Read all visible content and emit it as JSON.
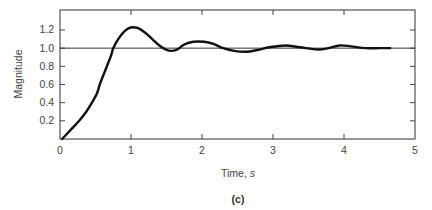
{
  "chart_data": {
    "type": "line",
    "title": "",
    "caption": "(c)",
    "xlabel": "Time, s",
    "xlabel_text": "Time, ",
    "xlabel_unit": "s",
    "ylabel": "Magnitude",
    "xlim": [
      0,
      5
    ],
    "ylim": [
      0,
      1.42
    ],
    "x_ticks": [
      0,
      1,
      2,
      3,
      4,
      5
    ],
    "x_tick_labels": [
      "0",
      "1",
      "2",
      "3",
      "4",
      "5"
    ],
    "y_ticks": [
      0.2,
      0.4,
      0.6,
      0.8,
      1.0,
      1.2
    ],
    "y_tick_labels": [
      "0.2",
      "0.4",
      "0.6",
      "0.8",
      "1.0",
      "1.2"
    ],
    "grid": false,
    "legend": null,
    "reference_line": {
      "y": 1.0,
      "label": "steady-state"
    },
    "series": [
      {
        "name": "Step response",
        "x": [
          0.03,
          0.15,
          0.27,
          0.37,
          0.45,
          0.52,
          0.56,
          0.62,
          0.66,
          0.72,
          0.75,
          0.82,
          0.9,
          0.97,
          1.03,
          1.1,
          1.2,
          1.3,
          1.4,
          1.5,
          1.58,
          1.66,
          1.75,
          1.88,
          2.03,
          2.15,
          2.3,
          2.45,
          2.62,
          2.78,
          2.95,
          3.17,
          3.38,
          3.63,
          3.78,
          3.94,
          4.1,
          4.3,
          4.5,
          4.65
        ],
        "y": [
          0.0,
          0.1,
          0.2,
          0.3,
          0.4,
          0.5,
          0.6,
          0.72,
          0.8,
          0.92,
          1.0,
          1.1,
          1.18,
          1.22,
          1.23,
          1.22,
          1.17,
          1.1,
          1.03,
          0.98,
          0.97,
          0.99,
          1.04,
          1.07,
          1.07,
          1.05,
          1.0,
          0.97,
          0.96,
          0.98,
          1.01,
          1.03,
          1.01,
          0.985,
          1.0,
          1.03,
          1.02,
          1.0,
          1.0,
          1.0
        ]
      }
    ]
  }
}
